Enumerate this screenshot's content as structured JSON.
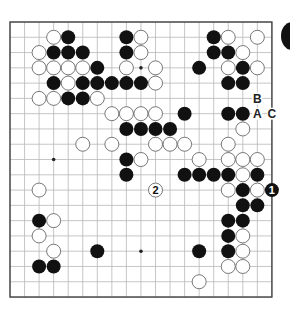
{
  "board": {
    "size": 19,
    "origin": {
      "x": 10,
      "y": 22
    },
    "spacing": {
      "x": 14.55,
      "y": 15.28
    },
    "stone_radius": 7,
    "line_color": "#b8b8b8",
    "edge_color": "#444444",
    "black": "#111111",
    "white": "#ffffff",
    "star_points": [
      [
        3,
        9
      ],
      [
        9,
        3
      ],
      [
        9,
        9
      ],
      [
        9,
        15
      ],
      [
        15,
        9
      ]
    ]
  },
  "stones": {
    "black": [
      [
        4,
        1
      ],
      [
        8,
        1
      ],
      [
        14,
        1
      ],
      [
        3,
        2
      ],
      [
        4,
        2
      ],
      [
        5,
        2
      ],
      [
        8,
        2
      ],
      [
        14,
        2
      ],
      [
        15,
        2
      ],
      [
        6,
        3
      ],
      [
        13,
        3
      ],
      [
        16,
        3
      ],
      [
        3,
        4
      ],
      [
        5,
        4
      ],
      [
        6,
        4
      ],
      [
        7,
        4
      ],
      [
        8,
        4
      ],
      [
        9,
        4
      ],
      [
        15,
        4
      ],
      [
        16,
        4
      ],
      [
        4,
        5
      ],
      [
        5,
        5
      ],
      [
        12,
        6
      ],
      [
        15,
        6
      ],
      [
        16,
        6
      ],
      [
        8,
        7
      ],
      [
        9,
        7
      ],
      [
        10,
        7
      ],
      [
        11,
        7
      ],
      [
        8,
        9
      ],
      [
        8,
        10
      ],
      [
        12,
        10
      ],
      [
        13,
        10
      ],
      [
        14,
        10
      ],
      [
        15,
        10
      ],
      [
        17,
        10
      ],
      [
        16,
        11
      ],
      [
        16,
        12
      ],
      [
        17,
        12
      ],
      [
        2,
        13
      ],
      [
        15,
        13
      ],
      [
        16,
        13
      ],
      [
        15,
        14
      ],
      [
        6,
        15
      ],
      [
        13,
        15
      ],
      [
        15,
        15
      ],
      [
        2,
        16
      ],
      [
        3,
        16
      ]
    ],
    "white": [
      [
        3,
        1
      ],
      [
        9,
        1
      ],
      [
        15,
        1
      ],
      [
        17,
        1
      ],
      [
        2,
        2
      ],
      [
        9,
        2
      ],
      [
        16,
        2
      ],
      [
        2,
        3
      ],
      [
        3,
        3
      ],
      [
        4,
        3
      ],
      [
        5,
        3
      ],
      [
        8,
        3
      ],
      [
        10,
        3
      ],
      [
        15,
        3
      ],
      [
        17,
        3
      ],
      [
        4,
        4
      ],
      [
        10,
        4
      ],
      [
        2,
        5
      ],
      [
        3,
        5
      ],
      [
        6,
        5
      ],
      [
        7,
        6
      ],
      [
        8,
        6
      ],
      [
        9,
        6
      ],
      [
        10,
        6
      ],
      [
        16,
        7
      ],
      [
        5,
        8
      ],
      [
        7,
        8
      ],
      [
        10,
        8
      ],
      [
        11,
        8
      ],
      [
        12,
        8
      ],
      [
        15,
        8
      ],
      [
        9,
        9
      ],
      [
        13,
        9
      ],
      [
        15,
        9
      ],
      [
        16,
        9
      ],
      [
        17,
        9
      ],
      [
        16,
        10
      ],
      [
        2,
        11
      ],
      [
        15,
        11
      ],
      [
        17,
        11
      ],
      [
        3,
        13
      ],
      [
        2,
        14
      ],
      [
        16,
        14
      ],
      [
        3,
        15
      ],
      [
        16,
        15
      ],
      [
        15,
        16
      ],
      [
        16,
        16
      ],
      [
        13,
        17
      ]
    ],
    "numbered": [
      {
        "col": 18,
        "row": 11,
        "color": "black",
        "label": "1"
      },
      {
        "col": 10,
        "row": 11,
        "color": "white",
        "label": "2"
      }
    ]
  },
  "labels": [
    {
      "col": 17,
      "row": 5,
      "text": "B"
    },
    {
      "col": 17,
      "row": 6,
      "text": "A"
    },
    {
      "col": 18,
      "row": 6,
      "text": "C"
    }
  ]
}
